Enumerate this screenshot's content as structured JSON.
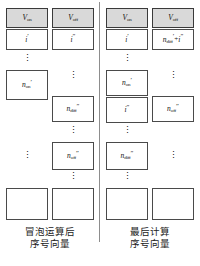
{
  "figure": {
    "title_visible": false,
    "panels": [
      {
        "id": "left",
        "caption_line1": "冒泡运算后",
        "caption_line2": "序号向量",
        "columns": [
          {
            "id": "v-on",
            "header": "V",
            "header_sub": "on",
            "items": [
              {
                "kind": "cell",
                "base": "i",
                "sub": "",
                "prime": "′"
              },
              {
                "kind": "dots"
              },
              {
                "kind": "cell",
                "base": "n",
                "sub": "on",
                "prime": "′"
              },
              {
                "kind": "dots"
              },
              {
                "kind": "cell",
                "base": "",
                "sub": "",
                "prime": ""
              }
            ]
          },
          {
            "id": "v-off",
            "header": "V",
            "header_sub": "off",
            "items": [
              {
                "kind": "cell",
                "base": "i",
                "sub": "",
                "prime": "″"
              },
              {
                "kind": "dots"
              },
              {
                "kind": "cell",
                "base": "n",
                "sub": "diff",
                "prime": "″"
              },
              {
                "kind": "dots"
              },
              {
                "kind": "cell",
                "base": "n",
                "sub": "off",
                "prime": "″"
              },
              {
                "kind": "dots"
              },
              {
                "kind": "cell",
                "base": "",
                "sub": "",
                "prime": ""
              }
            ]
          }
        ]
      },
      {
        "id": "right",
        "caption_line1": "最后计算",
        "caption_line2": "序号向量",
        "columns": [
          {
            "id": "v-on",
            "header": "V",
            "header_sub": "on",
            "items": [
              {
                "kind": "cell",
                "base": "i",
                "sub": "",
                "prime": "′"
              },
              {
                "kind": "dots"
              },
              {
                "kind": "cell",
                "base": "n",
                "sub": "on",
                "prime": "′"
              },
              {
                "kind": "cell",
                "base": "i",
                "sub": "",
                "prime": "″"
              },
              {
                "kind": "dots"
              },
              {
                "kind": "cell",
                "base": "n",
                "sub": "diff",
                "prime": "″"
              },
              {
                "kind": "dots"
              },
              {
                "kind": "cell",
                "base": "",
                "sub": "",
                "prime": ""
              }
            ]
          },
          {
            "id": "v-off",
            "header": "V",
            "header_sub": "off",
            "items": [
              {
                "kind": "cell",
                "base": "n",
                "sub": "diff",
                "prime": "′",
                "op": "+",
                "base2": "i",
                "prime2": "″"
              },
              {
                "kind": "dots"
              },
              {
                "kind": "cell",
                "base": "n",
                "sub": "off",
                "prime": "″"
              },
              {
                "kind": "dots"
              },
              {
                "kind": "cell",
                "base": "",
                "sub": "",
                "prime": ""
              }
            ]
          }
        ]
      }
    ]
  },
  "layout": {
    "left": {
      "col_a": [
        {
          "type": "head",
          "top": 8,
          "h": 20
        },
        {
          "type": "cell",
          "top": 29,
          "h": 21,
          "item": 0
        },
        {
          "type": "dots",
          "top": 53,
          "h": 14,
          "item": 1
        },
        {
          "type": "cell",
          "top": 70,
          "h": 30,
          "item": 2
        },
        {
          "type": "dots",
          "top": 150,
          "h": 14,
          "item": 3
        },
        {
          "type": "cell",
          "top": 188,
          "h": 32,
          "item": 4
        }
      ],
      "col_b": [
        {
          "type": "head",
          "top": 8,
          "h": 20
        },
        {
          "type": "cell",
          "top": 29,
          "h": 21,
          "item": 0
        },
        {
          "type": "dots",
          "top": 70,
          "h": 14,
          "item": 1
        },
        {
          "type": "cell",
          "top": 96,
          "h": 26,
          "item": 2
        },
        {
          "type": "dots",
          "top": 126,
          "h": 12,
          "item": 3
        },
        {
          "type": "cell",
          "top": 142,
          "h": 28,
          "item": 4
        },
        {
          "type": "dots",
          "top": 172,
          "h": 12,
          "item": 5
        },
        {
          "type": "cell",
          "top": 188,
          "h": 32,
          "item": 6
        }
      ]
    },
    "right": {
      "col_a": [
        {
          "type": "head",
          "top": 8,
          "h": 20
        },
        {
          "type": "cell",
          "top": 29,
          "h": 21,
          "item": 0
        },
        {
          "type": "dots",
          "top": 53,
          "h": 14,
          "item": 1
        },
        {
          "type": "cell",
          "top": 70,
          "h": 26,
          "item": 2
        },
        {
          "type": "cell",
          "top": 97,
          "h": 26,
          "item": 3
        },
        {
          "type": "dots",
          "top": 126,
          "h": 12,
          "item": 4
        },
        {
          "type": "cell",
          "top": 142,
          "h": 28,
          "item": 5
        },
        {
          "type": "dots",
          "top": 172,
          "h": 12,
          "item": 6
        },
        {
          "type": "cell",
          "top": 188,
          "h": 32,
          "item": 7
        }
      ],
      "col_b": [
        {
          "type": "head",
          "top": 8,
          "h": 20
        },
        {
          "type": "cell",
          "top": 29,
          "h": 21,
          "item": 0
        },
        {
          "type": "dots",
          "top": 70,
          "h": 14,
          "item": 1
        },
        {
          "type": "cell",
          "top": 96,
          "h": 26,
          "item": 2
        },
        {
          "type": "dots",
          "top": 150,
          "h": 14,
          "item": 3
        },
        {
          "type": "cell",
          "top": 188,
          "h": 32,
          "item": 4
        }
      ]
    },
    "caption_top": 226
  },
  "colors": {
    "header_fill": "#d9d9d9",
    "border": "#4a4a4a",
    "text": "#111111",
    "background": "#ffffff"
  }
}
